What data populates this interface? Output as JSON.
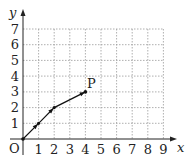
{
  "diagram": {
    "type": "coordinate-grid-path",
    "x_axis": {
      "label": "x",
      "ticks": [
        "1",
        "2",
        "3",
        "4",
        "5",
        "6",
        "7",
        "8",
        "9"
      ],
      "range": [
        0,
        9
      ]
    },
    "y_axis": {
      "label": "y",
      "ticks": [
        "1",
        "2",
        "3",
        "4",
        "5",
        "6",
        "7"
      ],
      "range": [
        0,
        7
      ]
    },
    "origin_label": "O",
    "point_label": "P",
    "path_points": [
      [
        0,
        0
      ],
      [
        1,
        1
      ],
      [
        2,
        2
      ],
      [
        4,
        3
      ]
    ],
    "colors": {
      "axis": "#222222",
      "grid": "#999999",
      "path": "#111111"
    }
  }
}
